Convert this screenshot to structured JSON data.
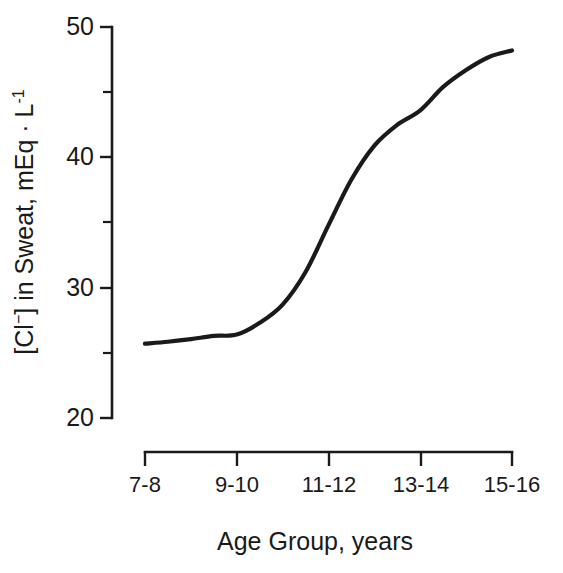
{
  "chart_data": {
    "type": "line",
    "title": "",
    "xlabel": "Age Group,  years",
    "ylabel": "[Cl⁻] in Sweat, mEq · L⁻¹",
    "ylabel_parts": {
      "pre": "[Cl",
      "sup_minus": "−",
      "mid": "] in Sweat, mEq · L",
      "sup_exp": "-1"
    },
    "categories": [
      "7-8",
      "9-10",
      "11-12",
      "13-14",
      "15-16"
    ],
    "values": [
      25.7,
      26.4,
      34.8,
      43.6,
      48.2
    ],
    "x": [
      1,
      2,
      3,
      4,
      5
    ],
    "xlim": [
      1,
      5
    ],
    "ylim": [
      20,
      50
    ],
    "ytick_labels": [
      "20",
      "30",
      "40",
      "50"
    ],
    "ytick_values": [
      20,
      30,
      40,
      50
    ],
    "yminor_values": [
      25,
      35,
      45
    ],
    "grid": false,
    "legend": null,
    "line_color": "#1a1a1a",
    "background_color": "#ffffff",
    "curve_shape": "sigmoid",
    "curve_points": [
      {
        "x": 1.0,
        "y": 25.7
      },
      {
        "x": 1.25,
        "y": 25.85
      },
      {
        "x": 1.5,
        "y": 26.05
      },
      {
        "x": 1.75,
        "y": 26.3
      },
      {
        "x": 2.0,
        "y": 26.4
      },
      {
        "x": 2.25,
        "y": 27.3
      },
      {
        "x": 2.5,
        "y": 28.7
      },
      {
        "x": 2.75,
        "y": 31.2
      },
      {
        "x": 3.0,
        "y": 34.8
      },
      {
        "x": 3.25,
        "y": 38.3
      },
      {
        "x": 3.5,
        "y": 40.9
      },
      {
        "x": 3.75,
        "y": 42.5
      },
      {
        "x": 4.0,
        "y": 43.6
      },
      {
        "x": 4.25,
        "y": 45.4
      },
      {
        "x": 4.5,
        "y": 46.7
      },
      {
        "x": 4.75,
        "y": 47.7
      },
      {
        "x": 5.0,
        "y": 48.2
      }
    ]
  },
  "axes": {
    "y_axis_name": "y-axis",
    "x_axis_name": "x-axis"
  }
}
